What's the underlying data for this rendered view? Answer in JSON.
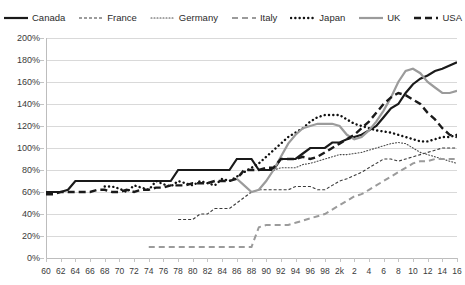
{
  "chart_data": {
    "type": "line",
    "title": "",
    "subtitle": "",
    "xlabel": "",
    "ylabel": "",
    "ylim": [
      0,
      200
    ],
    "xlim": [
      1960,
      2016
    ],
    "grid": true,
    "legend_position": "top",
    "y_ticks": [
      "0%",
      "20%",
      "40%",
      "60%",
      "80%",
      "100%",
      "120%",
      "140%",
      "160%",
      "180%",
      "200%"
    ],
    "y_tick_values": [
      0,
      20,
      40,
      60,
      80,
      100,
      120,
      140,
      160,
      180,
      200
    ],
    "x_ticks": [
      "60",
      "62",
      "64",
      "66",
      "68",
      "70",
      "72",
      "74",
      "76",
      "78",
      "80",
      "82",
      "84",
      "86",
      "88",
      "90",
      "92",
      "94",
      "96",
      "98",
      "2k",
      "2",
      "4",
      "6",
      "8",
      "10",
      "12",
      "14",
      "16"
    ],
    "x_tick_values": [
      1960,
      1962,
      1964,
      1966,
      1968,
      1970,
      1972,
      1974,
      1976,
      1978,
      1980,
      1982,
      1984,
      1986,
      1988,
      1990,
      1992,
      1994,
      1996,
      1998,
      2000,
      2002,
      2004,
      2006,
      2008,
      2010,
      2012,
      2014,
      2016
    ],
    "series": [
      {
        "name": "Canada",
        "color": "#1a1a1a",
        "style": "solid",
        "width": 2.2,
        "x": [
          1960,
          1961,
          1962,
          1963,
          1964,
          1965,
          1966,
          1967,
          1968,
          1969,
          1970,
          1971,
          1972,
          1973,
          1974,
          1975,
          1976,
          1977,
          1978,
          1979,
          1980,
          1981,
          1982,
          1983,
          1984,
          1985,
          1986,
          1987,
          1988,
          1989,
          1990,
          1991,
          1992,
          1993,
          1994,
          1995,
          1996,
          1997,
          1998,
          1999,
          2000,
          2001,
          2002,
          2003,
          2004,
          2005,
          2006,
          2007,
          2008,
          2009,
          2010,
          2011,
          2012,
          2013,
          2014,
          2015,
          2016
        ],
        "values": [
          60,
          60,
          60,
          62,
          70,
          70,
          70,
          70,
          70,
          70,
          70,
          70,
          70,
          70,
          70,
          70,
          70,
          70,
          80,
          80,
          80,
          80,
          80,
          80,
          80,
          80,
          90,
          90,
          90,
          80,
          80,
          80,
          90,
          90,
          90,
          95,
          100,
          100,
          100,
          105,
          105,
          108,
          110,
          112,
          116,
          120,
          128,
          136,
          140,
          150,
          158,
          163,
          166,
          170,
          172,
          175,
          178
        ]
      },
      {
        "name": "France",
        "color": "#3a3a3a",
        "style": "dash-thin",
        "width": 1.1,
        "x": [
          1978,
          1979,
          1980,
          1981,
          1982,
          1983,
          1984,
          1985,
          1986,
          1987,
          1988,
          1989,
          1990,
          1991,
          1992,
          1993,
          1994,
          1995,
          1996,
          1997,
          1998,
          1999,
          2000,
          2001,
          2002,
          2003,
          2004,
          2005,
          2006,
          2007,
          2008,
          2009,
          2010,
          2011,
          2012,
          2013,
          2014,
          2015,
          2016
        ],
        "values": [
          35,
          35,
          35,
          40,
          40,
          45,
          45,
          45,
          50,
          55,
          60,
          62,
          62,
          62,
          62,
          62,
          65,
          65,
          65,
          62,
          62,
          66,
          70,
          72,
          75,
          78,
          82,
          86,
          90,
          90,
          88,
          90,
          92,
          94,
          96,
          98,
          100,
          100,
          100
        ]
      },
      {
        "name": "Germany",
        "color": "#4a4a4a",
        "style": "dot-fine",
        "width": 1.1,
        "x": [
          1991,
          1992,
          1993,
          1994,
          1995,
          1996,
          1997,
          1998,
          1999,
          2000,
          2001,
          2002,
          2003,
          2004,
          2005,
          2006,
          2007,
          2008,
          2009,
          2010,
          2011,
          2012,
          2013,
          2014,
          2015,
          2016
        ],
        "values": [
          80,
          82,
          82,
          82,
          85,
          86,
          88,
          90,
          92,
          94,
          94,
          95,
          96,
          98,
          100,
          102,
          104,
          105,
          104,
          100,
          96,
          94,
          92,
          90,
          88,
          86
        ]
      },
      {
        "name": "Italy",
        "color": "#9b9b9b",
        "style": "dash-gray",
        "width": 2.0,
        "x": [
          1974,
          1975,
          1976,
          1977,
          1978,
          1979,
          1980,
          1981,
          1982,
          1983,
          1984,
          1985,
          1986,
          1987,
          1988,
          1989,
          1990,
          1991,
          1992,
          1993,
          1994,
          1995,
          1996,
          1997,
          1998,
          1999,
          2000,
          2001,
          2002,
          2003,
          2004,
          2005,
          2006,
          2007,
          2008,
          2009,
          2010,
          2011,
          2012,
          2013,
          2014,
          2015,
          2016
        ],
        "values": [
          10,
          10,
          10,
          10,
          10,
          10,
          10,
          10,
          10,
          10,
          10,
          10,
          10,
          10,
          10,
          28,
          30,
          30,
          30,
          30,
          32,
          34,
          36,
          38,
          40,
          44,
          48,
          52,
          56,
          58,
          62,
          66,
          70,
          74,
          78,
          82,
          86,
          88,
          88,
          90,
          90,
          90,
          90
        ]
      },
      {
        "name": "Japan",
        "color": "#111111",
        "style": "dot-round",
        "width": 2.4,
        "x": [
          1968,
          1969,
          1970,
          1971,
          1972,
          1973,
          1974,
          1975,
          1976,
          1977,
          1978,
          1979,
          1980,
          1981,
          1982,
          1983,
          1984,
          1985,
          1986,
          1987,
          1988,
          1989,
          1990,
          1991,
          1992,
          1993,
          1994,
          1995,
          1996,
          1997,
          1998,
          1999,
          2000,
          2001,
          2002,
          2003,
          2004,
          2005,
          2006,
          2007,
          2008,
          2009,
          2010,
          2011,
          2012,
          2013,
          2014,
          2015,
          2016
        ],
        "values": [
          65,
          65,
          63,
          60,
          66,
          64,
          62,
          70,
          67,
          65,
          70,
          68,
          66,
          70,
          68,
          66,
          72,
          70,
          74,
          78,
          82,
          86,
          92,
          98,
          104,
          110,
          114,
          118,
          124,
          128,
          130,
          130,
          130,
          126,
          122,
          120,
          118,
          116,
          115,
          114,
          112,
          110,
          108,
          106,
          106,
          108,
          110,
          110,
          112
        ]
      },
      {
        "name": "UK",
        "color": "#9b9b9b",
        "style": "solid",
        "width": 2.2,
        "x": [
          1986,
          1987,
          1988,
          1989,
          1990,
          1991,
          1992,
          1993,
          1994,
          1995,
          1996,
          1997,
          1998,
          1999,
          2000,
          2001,
          2002,
          2003,
          2004,
          2005,
          2006,
          2007,
          2008,
          2009,
          2010,
          2011,
          2012,
          2013,
          2014,
          2015,
          2016
        ],
        "values": [
          72,
          66,
          60,
          62,
          70,
          80,
          92,
          104,
          112,
          118,
          120,
          122,
          122,
          122,
          120,
          112,
          108,
          110,
          116,
          124,
          134,
          146,
          160,
          170,
          172,
          168,
          160,
          155,
          150,
          150,
          152
        ]
      },
      {
        "name": "USA",
        "color": "#1a1a1a",
        "style": "dash-thick",
        "width": 2.4,
        "x": [
          1960,
          1961,
          1962,
          1963,
          1964,
          1965,
          1966,
          1967,
          1968,
          1969,
          1970,
          1971,
          1972,
          1973,
          1974,
          1975,
          1976,
          1977,
          1978,
          1979,
          1980,
          1981,
          1982,
          1983,
          1984,
          1985,
          1986,
          1987,
          1988,
          1989,
          1990,
          1991,
          1992,
          1993,
          1994,
          1995,
          1996,
          1997,
          1998,
          1999,
          2000,
          2001,
          2002,
          2003,
          2004,
          2005,
          2006,
          2007,
          2008,
          2009,
          2010,
          2011,
          2012,
          2013,
          2014,
          2015,
          2016
        ],
        "values": [
          58,
          58,
          60,
          60,
          60,
          60,
          60,
          62,
          62,
          60,
          60,
          62,
          60,
          62,
          62,
          64,
          64,
          66,
          66,
          66,
          68,
          68,
          68,
          70,
          70,
          70,
          72,
          80,
          80,
          80,
          82,
          82,
          90,
          90,
          90,
          92,
          90,
          92,
          96,
          100,
          104,
          108,
          112,
          118,
          124,
          132,
          140,
          146,
          150,
          148,
          144,
          140,
          132,
          126,
          118,
          112,
          110
        ]
      }
    ]
  },
  "legend": {
    "items": [
      {
        "label": "Canada",
        "series": "Canada"
      },
      {
        "label": "France",
        "series": "France"
      },
      {
        "label": "Germany",
        "series": "Germany"
      },
      {
        "label": "Italy",
        "series": "Italy"
      },
      {
        "label": "Japan",
        "series": "Japan"
      },
      {
        "label": "UK",
        "series": "UK"
      },
      {
        "label": "USA",
        "series": "USA"
      }
    ]
  },
  "colors": {
    "black": "#1a1a1a",
    "gray": "#9b9b9b",
    "gridline": "#d9d9d9",
    "axis": "#bdbdbd",
    "background": "#ffffff"
  }
}
